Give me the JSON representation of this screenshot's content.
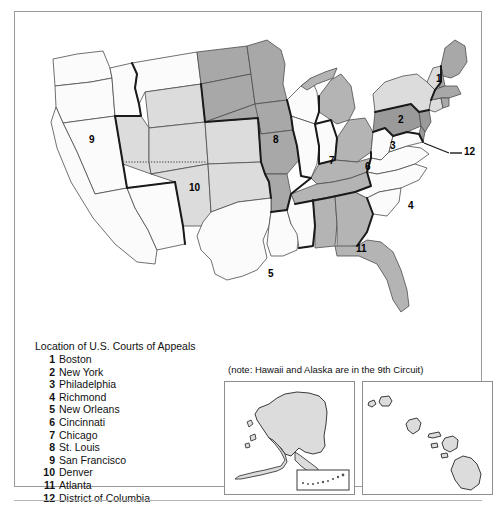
{
  "figure": {
    "legend_title": "Location of U.S. Courts of Appeals",
    "note": "(note: Hawaii and Alaska are in the 9th Circuit)",
    "circuits": [
      {
        "number": "1",
        "city": "Boston"
      },
      {
        "number": "2",
        "city": "New York"
      },
      {
        "number": "3",
        "city": "Philadelphia"
      },
      {
        "number": "4",
        "city": "Richmond"
      },
      {
        "number": "5",
        "city": "New Orleans"
      },
      {
        "number": "6",
        "city": "Cincinnati"
      },
      {
        "number": "7",
        "city": "Chicago"
      },
      {
        "number": "8",
        "city": "St. Louis"
      },
      {
        "number": "9",
        "city": "San Francisco"
      },
      {
        "number": "10",
        "city": "Denver"
      },
      {
        "number": "11",
        "city": "Atlanta"
      },
      {
        "number": "12",
        "city": "District of Columbia"
      }
    ],
    "map_labels": {
      "l1": "1",
      "l2": "2",
      "l3": "3",
      "l4": "4",
      "l5": "5",
      "l6": "6",
      "l7": "7",
      "l8": "8",
      "l9": "9",
      "l10": "10",
      "l11": "11",
      "l12": "12"
    },
    "insets": {
      "alaska_name": "Alaska",
      "hawaii_name": "Hawaii"
    },
    "colors": {
      "shade_white": "#fbfbfb",
      "shade_light": "#dcdcdc",
      "shade_medium": "#b4b4b4",
      "shade_dark": "#9a9a9a",
      "outline": "#1a1a1a",
      "state_line": "#4d4d4d",
      "frame": "#9a9a9a",
      "text": "#111111"
    }
  }
}
